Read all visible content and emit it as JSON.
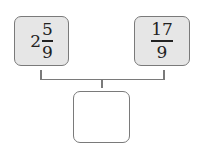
{
  "left_box": {
    "whole": "2",
    "numerator": "5",
    "denominator": "9",
    "label": "2 5/9"
  },
  "right_box": {
    "numerator": "17",
    "denominator": "9",
    "label": "17/9"
  },
  "answer_box": {
    "value": ""
  },
  "colors": {
    "box_fill": "#e6e6e6",
    "border": "#7a7a7a",
    "text": "#222222"
  }
}
